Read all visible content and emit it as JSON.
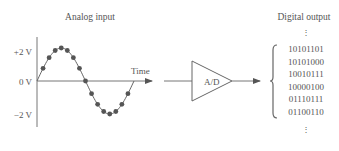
{
  "analog": {
    "title": "Analog input",
    "y_labels": [
      "+2 V",
      "0 V",
      "−2 V"
    ],
    "x_label": "Time"
  },
  "converter": {
    "label": "A/D"
  },
  "digital": {
    "title": "Digital output",
    "ellipsis_top": "⋮",
    "ellipsis_bottom": "⋮",
    "codes": [
      "10101101",
      "10101000",
      "10010111",
      "10000100",
      "01110111",
      "01100110"
    ]
  },
  "colors": {
    "line": "#666666",
    "dot": "#555555",
    "text": "#555555"
  }
}
